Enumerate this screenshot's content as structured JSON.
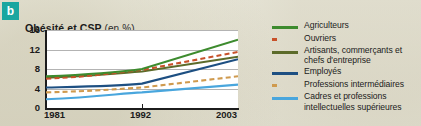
{
  "badge": {
    "label": "b"
  },
  "figure": {
    "title_main": "Obésité et CSP",
    "title_unit": "(en %)"
  },
  "chart_data": {
    "type": "line",
    "title": "Obésité et CSP (en %)",
    "xlabel": "",
    "ylabel": "",
    "x": [
      "1981",
      "1992",
      "2003"
    ],
    "categories": [
      "1981",
      "1992",
      "2003"
    ],
    "ylim": [
      0,
      16
    ],
    "yticks": [
      0,
      4,
      8,
      12,
      16
    ],
    "ytick_labels": [
      "0",
      "4",
      "8",
      "12",
      "16"
    ],
    "xtick_labels": [
      "1981",
      "1992",
      "2003"
    ],
    "grid": true,
    "legend_position": "right",
    "series": [
      {
        "name": "Agriculteurs",
        "values": [
          6.5,
          8.0,
          14.0
        ],
        "color": "#3d8b2e",
        "style": "solid"
      },
      {
        "name": "Ouvriers",
        "values": [
          6.0,
          7.8,
          11.5
        ],
        "color": "#c8512a",
        "style": "dashed"
      },
      {
        "name": "Artisants, commerçants et chefs d'entreprise",
        "values": [
          6.2,
          7.5,
          10.5
        ],
        "color": "#5c6b2a",
        "style": "solid"
      },
      {
        "name": "Employés",
        "values": [
          4.2,
          5.0,
          10.0
        ],
        "color": "#1d4f82",
        "style": "solid"
      },
      {
        "name": "Professions intermédiaires",
        "values": [
          3.2,
          4.2,
          6.5
        ],
        "color": "#cf9a4e",
        "style": "dashed"
      },
      {
        "name": "Cadres et professions intellectuelles supérieures",
        "values": [
          1.8,
          3.2,
          4.8
        ],
        "color": "#49a6dd",
        "style": "solid"
      }
    ]
  },
  "legend": {
    "items": [
      {
        "label": "Agriculteurs"
      },
      {
        "label": "Ouvriers"
      },
      {
        "label": "Artisants, commerçants et chefs d'entreprise"
      },
      {
        "label": "Employés"
      },
      {
        "label": "Professions intermédiaires"
      },
      {
        "label": "Cadres et professions intellectuelles supérieures"
      }
    ]
  }
}
